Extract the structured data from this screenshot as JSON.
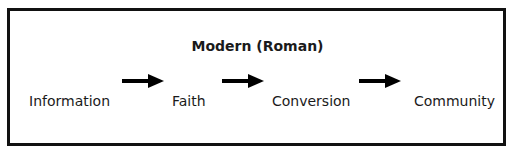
{
  "diagram": {
    "title": "Modern (Roman)",
    "stages": [
      {
        "label": "Information"
      },
      {
        "label": "Faith"
      },
      {
        "label": "Conversion"
      },
      {
        "label": "Community"
      }
    ],
    "arrows": [
      "arrow-right",
      "arrow-right",
      "arrow-right"
    ],
    "colors": {
      "border": "#111111",
      "text": "#1a1a1a",
      "arrow": "#000000",
      "background": "#ffffff"
    }
  }
}
